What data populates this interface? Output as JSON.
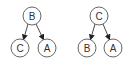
{
  "diagram": {
    "trees": [
      {
        "root": {
          "label": "B",
          "x": 32,
          "y": 16
        },
        "children": [
          {
            "label": "C",
            "x": 20,
            "y": 48
          },
          {
            "label": "A",
            "x": 47,
            "y": 48
          }
        ]
      },
      {
        "root": {
          "label": "C",
          "x": 99,
          "y": 16
        },
        "children": [
          {
            "label": "B",
            "x": 87,
            "y": 48
          },
          {
            "label": "A",
            "x": 113,
            "y": 48
          }
        ]
      }
    ],
    "node_radius": 9
  }
}
